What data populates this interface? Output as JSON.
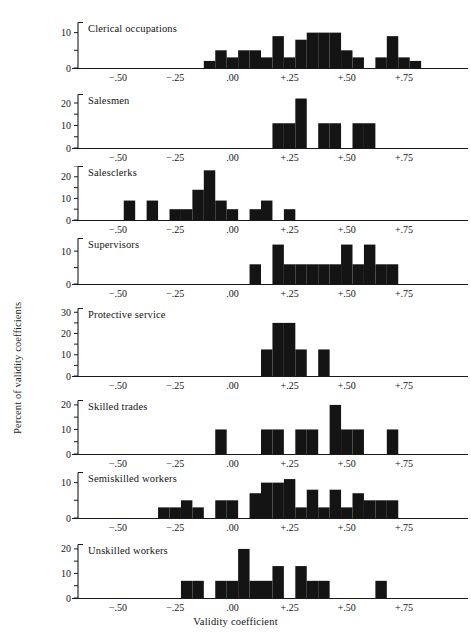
{
  "figure": {
    "xlabel": "Validity coefficient",
    "ylabel": "Percent of validity coefficients",
    "xticks": [
      "−.50",
      "−.25",
      ".00",
      "+.25",
      "+.50",
      "+.75"
    ],
    "xtick_values": [
      -0.5,
      -0.25,
      0,
      0.25,
      0.5,
      0.75
    ],
    "xlim": [
      -0.675,
      0.925
    ],
    "ink_color": "#141414",
    "background_color": "#ffffff"
  },
  "chart_data": {
    "type": "bar",
    "title": "",
    "xlabel": "Validity coefficient",
    "ylabel": "Percent of validity coefficients",
    "xlim": [
      -0.675,
      0.925
    ],
    "grid": false,
    "legend": "none",
    "note": "Eight stacked histogram panels of validity coefficients by occupational group; each panel has its own y-axis scale in percent.",
    "panels": [
      {
        "name": "Clerical occupations",
        "ylim": [
          0,
          13
        ],
        "yticks": [
          0,
          10
        ],
        "ytick_labels": [
          "0",
          "10"
        ],
        "bins": [
          {
            "x0": -0.125,
            "x1": -0.075,
            "value": 2
          },
          {
            "x0": -0.075,
            "x1": -0.025,
            "value": 5
          },
          {
            "x0": -0.025,
            "x1": 0.025,
            "value": 3
          },
          {
            "x0": 0.025,
            "x1": 0.075,
            "value": 5
          },
          {
            "x0": 0.075,
            "x1": 0.125,
            "value": 5
          },
          {
            "x0": 0.125,
            "x1": 0.175,
            "value": 3
          },
          {
            "x0": 0.175,
            "x1": 0.225,
            "value": 9
          },
          {
            "x0": 0.225,
            "x1": 0.275,
            "value": 3
          },
          {
            "x0": 0.275,
            "x1": 0.325,
            "value": 8
          },
          {
            "x0": 0.325,
            "x1": 0.375,
            "value": 10
          },
          {
            "x0": 0.375,
            "x1": 0.425,
            "value": 10
          },
          {
            "x0": 0.425,
            "x1": 0.475,
            "value": 10
          },
          {
            "x0": 0.475,
            "x1": 0.525,
            "value": 5
          },
          {
            "x0": 0.525,
            "x1": 0.575,
            "value": 3
          },
          {
            "x0": 0.575,
            "x1": 0.625,
            "value": 0
          },
          {
            "x0": 0.625,
            "x1": 0.675,
            "value": 3
          },
          {
            "x0": 0.675,
            "x1": 0.725,
            "value": 9
          },
          {
            "x0": 0.725,
            "x1": 0.775,
            "value": 3
          },
          {
            "x0": 0.775,
            "x1": 0.825,
            "value": 2
          }
        ]
      },
      {
        "name": "Salesmen",
        "ylim": [
          0,
          24
        ],
        "yticks": [
          0,
          10,
          20
        ],
        "ytick_labels": [
          "0",
          "10",
          "20"
        ],
        "bins": [
          {
            "x0": 0.175,
            "x1": 0.225,
            "value": 11
          },
          {
            "x0": 0.225,
            "x1": 0.275,
            "value": 11
          },
          {
            "x0": 0.275,
            "x1": 0.325,
            "value": 22
          },
          {
            "x0": 0.325,
            "x1": 0.375,
            "value": 0
          },
          {
            "x0": 0.375,
            "x1": 0.425,
            "value": 11
          },
          {
            "x0": 0.425,
            "x1": 0.475,
            "value": 11
          },
          {
            "x0": 0.475,
            "x1": 0.525,
            "value": 0
          },
          {
            "x0": 0.525,
            "x1": 0.575,
            "value": 11
          },
          {
            "x0": 0.575,
            "x1": 0.625,
            "value": 11
          }
        ]
      },
      {
        "name": "Salesclerks",
        "ylim": [
          0,
          25
        ],
        "yticks": [
          0,
          10,
          20
        ],
        "ytick_labels": [
          "0",
          "10",
          "20"
        ],
        "bins": [
          {
            "x0": -0.475,
            "x1": -0.425,
            "value": 9
          },
          {
            "x0": -0.425,
            "x1": -0.375,
            "value": 0
          },
          {
            "x0": -0.375,
            "x1": -0.325,
            "value": 9
          },
          {
            "x0": -0.325,
            "x1": -0.275,
            "value": 0
          },
          {
            "x0": -0.275,
            "x1": -0.225,
            "value": 5
          },
          {
            "x0": -0.225,
            "x1": -0.175,
            "value": 5
          },
          {
            "x0": -0.175,
            "x1": -0.125,
            "value": 14
          },
          {
            "x0": -0.125,
            "x1": -0.075,
            "value": 23
          },
          {
            "x0": -0.075,
            "x1": -0.025,
            "value": 9
          },
          {
            "x0": -0.025,
            "x1": 0.025,
            "value": 5
          },
          {
            "x0": 0.025,
            "x1": 0.075,
            "value": 0
          },
          {
            "x0": 0.075,
            "x1": 0.125,
            "value": 5
          },
          {
            "x0": 0.125,
            "x1": 0.175,
            "value": 9
          },
          {
            "x0": 0.175,
            "x1": 0.225,
            "value": 0
          },
          {
            "x0": 0.225,
            "x1": 0.275,
            "value": 5
          }
        ]
      },
      {
        "name": "Supervisors",
        "ylim": [
          0,
          14
        ],
        "yticks": [
          0,
          10
        ],
        "ytick_labels": [
          "0",
          "10"
        ],
        "bins": [
          {
            "x0": 0.075,
            "x1": 0.125,
            "value": 6
          },
          {
            "x0": 0.125,
            "x1": 0.175,
            "value": 0
          },
          {
            "x0": 0.175,
            "x1": 0.225,
            "value": 12
          },
          {
            "x0": 0.225,
            "x1": 0.275,
            "value": 6
          },
          {
            "x0": 0.275,
            "x1": 0.325,
            "value": 6
          },
          {
            "x0": 0.325,
            "x1": 0.375,
            "value": 6
          },
          {
            "x0": 0.375,
            "x1": 0.425,
            "value": 6
          },
          {
            "x0": 0.425,
            "x1": 0.475,
            "value": 6
          },
          {
            "x0": 0.475,
            "x1": 0.525,
            "value": 12
          },
          {
            "x0": 0.525,
            "x1": 0.575,
            "value": 6
          },
          {
            "x0": 0.575,
            "x1": 0.625,
            "value": 12
          },
          {
            "x0": 0.625,
            "x1": 0.675,
            "value": 6
          },
          {
            "x0": 0.675,
            "x1": 0.725,
            "value": 6
          }
        ]
      },
      {
        "name": "Protective service",
        "ylim": [
          0,
          32
        ],
        "yticks": [
          0,
          10,
          20,
          30
        ],
        "ytick_labels": [
          "0",
          "10",
          "20",
          "30"
        ],
        "bins": [
          {
            "x0": 0.125,
            "x1": 0.175,
            "value": 12.5
          },
          {
            "x0": 0.175,
            "x1": 0.225,
            "value": 25
          },
          {
            "x0": 0.225,
            "x1": 0.275,
            "value": 25
          },
          {
            "x0": 0.275,
            "x1": 0.325,
            "value": 12.5
          },
          {
            "x0": 0.325,
            "x1": 0.375,
            "value": 0
          },
          {
            "x0": 0.375,
            "x1": 0.425,
            "value": 12.5
          }
        ]
      },
      {
        "name": "Skilled trades",
        "ylim": [
          0,
          22
        ],
        "yticks": [
          0,
          10,
          20
        ],
        "ytick_labels": [
          "0",
          "10",
          "20"
        ],
        "bins": [
          {
            "x0": -0.075,
            "x1": -0.025,
            "value": 10
          },
          {
            "x0": -0.025,
            "x1": 0.025,
            "value": 0
          },
          {
            "x0": 0.025,
            "x1": 0.075,
            "value": 0
          },
          {
            "x0": 0.075,
            "x1": 0.125,
            "value": 0
          },
          {
            "x0": 0.125,
            "x1": 0.175,
            "value": 10
          },
          {
            "x0": 0.175,
            "x1": 0.225,
            "value": 10
          },
          {
            "x0": 0.225,
            "x1": 0.275,
            "value": 0
          },
          {
            "x0": 0.275,
            "x1": 0.325,
            "value": 10
          },
          {
            "x0": 0.325,
            "x1": 0.375,
            "value": 10
          },
          {
            "x0": 0.375,
            "x1": 0.425,
            "value": 0
          },
          {
            "x0": 0.425,
            "x1": 0.475,
            "value": 20
          },
          {
            "x0": 0.475,
            "x1": 0.525,
            "value": 10
          },
          {
            "x0": 0.525,
            "x1": 0.575,
            "value": 10
          },
          {
            "x0": 0.575,
            "x1": 0.625,
            "value": 0
          },
          {
            "x0": 0.625,
            "x1": 0.675,
            "value": 0
          },
          {
            "x0": 0.675,
            "x1": 0.725,
            "value": 10
          }
        ]
      },
      {
        "name": "Semiskilled workers",
        "ylim": [
          0,
          13
        ],
        "yticks": [
          0,
          10
        ],
        "ytick_labels": [
          "0",
          "10"
        ],
        "bins": [
          {
            "x0": -0.325,
            "x1": -0.275,
            "value": 3
          },
          {
            "x0": -0.275,
            "x1": -0.225,
            "value": 3
          },
          {
            "x0": -0.225,
            "x1": -0.175,
            "value": 5
          },
          {
            "x0": -0.175,
            "x1": -0.125,
            "value": 3
          },
          {
            "x0": -0.125,
            "x1": -0.075,
            "value": 0
          },
          {
            "x0": -0.075,
            "x1": -0.025,
            "value": 5
          },
          {
            "x0": -0.025,
            "x1": 0.025,
            "value": 5
          },
          {
            "x0": 0.025,
            "x1": 0.075,
            "value": 0
          },
          {
            "x0": 0.075,
            "x1": 0.125,
            "value": 7
          },
          {
            "x0": 0.125,
            "x1": 0.175,
            "value": 10
          },
          {
            "x0": 0.175,
            "x1": 0.225,
            "value": 10
          },
          {
            "x0": 0.225,
            "x1": 0.275,
            "value": 11
          },
          {
            "x0": 0.275,
            "x1": 0.325,
            "value": 3
          },
          {
            "x0": 0.325,
            "x1": 0.375,
            "value": 8
          },
          {
            "x0": 0.375,
            "x1": 0.425,
            "value": 3
          },
          {
            "x0": 0.425,
            "x1": 0.475,
            "value": 8
          },
          {
            "x0": 0.475,
            "x1": 0.525,
            "value": 3
          },
          {
            "x0": 0.525,
            "x1": 0.575,
            "value": 7
          },
          {
            "x0": 0.575,
            "x1": 0.625,
            "value": 5
          },
          {
            "x0": 0.625,
            "x1": 0.675,
            "value": 5
          },
          {
            "x0": 0.675,
            "x1": 0.725,
            "value": 5
          }
        ]
      },
      {
        "name": "Unskilled workers",
        "ylim": [
          0,
          22
        ],
        "yticks": [
          0,
          10,
          20
        ],
        "ytick_labels": [
          "0",
          "10",
          "20"
        ],
        "bins": [
          {
            "x0": -0.225,
            "x1": -0.175,
            "value": 7
          },
          {
            "x0": -0.175,
            "x1": -0.125,
            "value": 7
          },
          {
            "x0": -0.125,
            "x1": -0.075,
            "value": 0
          },
          {
            "x0": -0.075,
            "x1": -0.025,
            "value": 7
          },
          {
            "x0": -0.025,
            "x1": 0.025,
            "value": 7
          },
          {
            "x0": 0.025,
            "x1": 0.075,
            "value": 20
          },
          {
            "x0": 0.075,
            "x1": 0.125,
            "value": 7
          },
          {
            "x0": 0.125,
            "x1": 0.175,
            "value": 7
          },
          {
            "x0": 0.175,
            "x1": 0.225,
            "value": 13
          },
          {
            "x0": 0.225,
            "x1": 0.275,
            "value": 0
          },
          {
            "x0": 0.275,
            "x1": 0.325,
            "value": 13
          },
          {
            "x0": 0.325,
            "x1": 0.375,
            "value": 7
          },
          {
            "x0": 0.375,
            "x1": 0.425,
            "value": 7
          },
          {
            "x0": 0.425,
            "x1": 0.475,
            "value": 0
          },
          {
            "x0": 0.475,
            "x1": 0.525,
            "value": 0
          },
          {
            "x0": 0.525,
            "x1": 0.575,
            "value": 0
          },
          {
            "x0": 0.575,
            "x1": 0.625,
            "value": 0
          },
          {
            "x0": 0.625,
            "x1": 0.675,
            "value": 7
          }
        ]
      }
    ]
  },
  "layout": {
    "panel_tops": [
      22,
      94,
      166,
      238,
      308,
      400,
      472,
      544
    ],
    "panel_plot_heights": [
      46,
      54,
      54,
      46,
      68,
      54,
      46,
      54
    ],
    "axis_x_left": 78,
    "axis_x_right": 444
  }
}
